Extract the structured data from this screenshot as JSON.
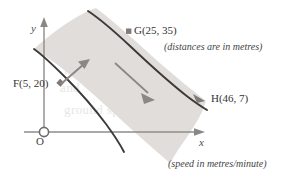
{
  "figure": {
    "colors": {
      "band_fill": "#dedbd8",
      "bank_stroke": "#3c3a38",
      "axis_stroke": "#8e8c8a",
      "arrow_fill": "#8a8785",
      "text": "#3a3a3a",
      "ghost_text": "#e9e6e4"
    }
  },
  "axes": {
    "y_label": "y",
    "x_label": "x",
    "origin_label": "O"
  },
  "points": [
    {
      "id": "F",
      "label": "F(5, 20)",
      "x": 5,
      "y": 20
    },
    {
      "id": "G",
      "label": "G(25, 35)",
      "x": 25,
      "y": 35
    },
    {
      "id": "H",
      "label": "H(46, 7)",
      "x": 46,
      "y": 7
    }
  ],
  "point_labels": {
    "F": "F(5, 20)",
    "G": "G(25, 35)",
    "H": "H(46, 7)"
  },
  "captions": {
    "distances": "(distances are in metres)",
    "speed": "(speed in metres/minute)"
  },
  "arrows": {
    "boat_heading": "short-arrow-up-right",
    "current_flow": "long-arrow-down-right"
  },
  "ghost_text": {
    "line1": "is sailing",
    "line2": "km/h in",
    "line3": "and",
    "line4": "ground spe"
  }
}
